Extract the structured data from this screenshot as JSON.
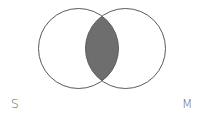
{
  "diagram": {
    "type": "venn",
    "sets": [
      {
        "label": "S",
        "cx": 78.5,
        "cy": 48.5,
        "r": 40
      },
      {
        "label": "M",
        "cx": 125.5,
        "cy": 48.5,
        "r": 40
      }
    ],
    "shaded_region": "S ∩ M",
    "colors": {
      "stroke": "#5a5a5a",
      "shade": "#6e6e6e",
      "label": "#6a6a6a",
      "background": "#ffffff"
    }
  }
}
